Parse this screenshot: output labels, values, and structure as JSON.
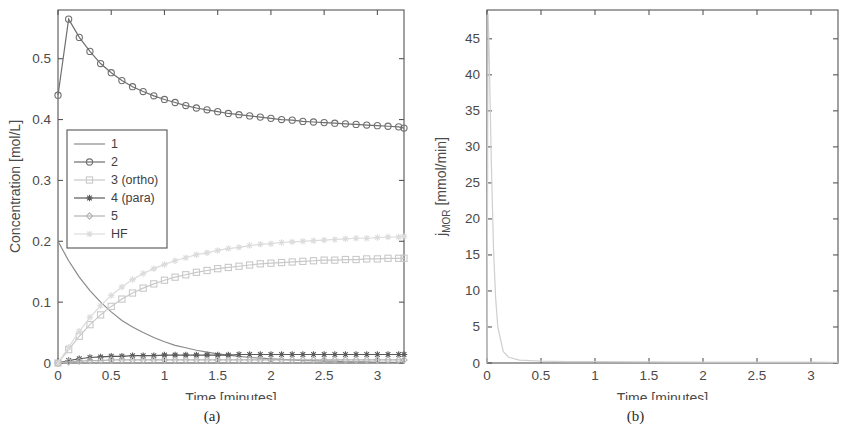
{
  "figure": {
    "caption_a": "(a)",
    "caption_b": "(b)"
  },
  "chart_data": [
    {
      "id": "panel-a",
      "type": "line",
      "title": "",
      "xlabel": "Time [minutes]",
      "ylabel": "Concentration [mol/L]",
      "xlim": [
        0,
        3.25
      ],
      "ylim": [
        0,
        0.58
      ],
      "xticks": [
        0,
        0.5,
        1,
        1.5,
        2,
        2.5,
        3
      ],
      "xticklabels": [
        "0",
        "0.5",
        "1",
        "1.5",
        "2",
        "2.5",
        "3"
      ],
      "yticks": [
        0,
        0.1,
        0.2,
        0.3,
        0.4,
        0.5
      ],
      "yticklabels": [
        "0",
        "0.1",
        "0.2",
        "0.3",
        "0.4",
        "0.5"
      ],
      "grid": false,
      "legend_position": "middle-left",
      "x": [
        0,
        0.1,
        0.2,
        0.3,
        0.4,
        0.5,
        0.6,
        0.7,
        0.8,
        0.9,
        1.0,
        1.1,
        1.2,
        1.3,
        1.4,
        1.5,
        1.6,
        1.7,
        1.8,
        1.9,
        2.0,
        2.1,
        2.2,
        2.3,
        2.4,
        2.5,
        2.6,
        2.7,
        2.8,
        2.9,
        3.0,
        3.1,
        3.2,
        3.25
      ],
      "series": [
        {
          "name": "1",
          "marker": "none",
          "color": "#8a8a8a",
          "values": [
            0.2,
            0.168,
            0.141,
            0.119,
            0.1,
            0.084,
            0.07,
            0.059,
            0.05,
            0.042,
            0.035,
            0.029,
            0.025,
            0.021,
            0.018,
            0.015,
            0.013,
            0.011,
            0.009,
            0.008,
            0.007,
            0.006,
            0.005,
            0.004,
            0.004,
            0.003,
            0.003,
            0.002,
            0.002,
            0.002,
            0.001,
            0.001,
            0.001,
            0.001
          ]
        },
        {
          "name": "2",
          "marker": "circle",
          "color": "#6f6f6f",
          "values": [
            0.44,
            0.565,
            0.535,
            0.512,
            0.492,
            0.477,
            0.464,
            0.454,
            0.446,
            0.439,
            0.433,
            0.428,
            0.423,
            0.419,
            0.416,
            0.413,
            0.41,
            0.408,
            0.406,
            0.404,
            0.402,
            0.4,
            0.399,
            0.397,
            0.396,
            0.395,
            0.394,
            0.393,
            0.392,
            0.391,
            0.39,
            0.389,
            0.388,
            0.386
          ]
        },
        {
          "name": "3 (ortho)",
          "marker": "square",
          "color": "#c9c9c9",
          "values": [
            0.0,
            0.022,
            0.044,
            0.063,
            0.079,
            0.093,
            0.105,
            0.115,
            0.123,
            0.13,
            0.136,
            0.141,
            0.145,
            0.149,
            0.152,
            0.155,
            0.157,
            0.159,
            0.161,
            0.163,
            0.164,
            0.165,
            0.166,
            0.167,
            0.168,
            0.169,
            0.169,
            0.17,
            0.17,
            0.171,
            0.171,
            0.172,
            0.172,
            0.172
          ]
        },
        {
          "name": "4 (para)",
          "marker": "star",
          "color": "#5a5a5a",
          "values": [
            0.0,
            0.004,
            0.007,
            0.009,
            0.01,
            0.011,
            0.011,
            0.012,
            0.012,
            0.012,
            0.013,
            0.013,
            0.013,
            0.013,
            0.013,
            0.013,
            0.013,
            0.014,
            0.014,
            0.014,
            0.014,
            0.014,
            0.014,
            0.014,
            0.014,
            0.014,
            0.014,
            0.014,
            0.014,
            0.014,
            0.014,
            0.014,
            0.014,
            0.014
          ]
        },
        {
          "name": "5",
          "marker": "diamond",
          "color": "#b4b4b4",
          "values": [
            0.0,
            0.002,
            0.003,
            0.004,
            0.004,
            0.005,
            0.005,
            0.005,
            0.005,
            0.005,
            0.005,
            0.005,
            0.005,
            0.005,
            0.005,
            0.005,
            0.005,
            0.005,
            0.005,
            0.005,
            0.005,
            0.005,
            0.005,
            0.005,
            0.005,
            0.005,
            0.005,
            0.005,
            0.005,
            0.005,
            0.005,
            0.005,
            0.005,
            0.005
          ]
        },
        {
          "name": "HF",
          "marker": "star",
          "color": "#dcdcdc",
          "values": [
            0.0,
            0.026,
            0.052,
            0.075,
            0.094,
            0.111,
            0.125,
            0.137,
            0.147,
            0.155,
            0.162,
            0.168,
            0.173,
            0.178,
            0.181,
            0.185,
            0.188,
            0.19,
            0.193,
            0.195,
            0.196,
            0.198,
            0.199,
            0.2,
            0.201,
            0.202,
            0.203,
            0.204,
            0.205,
            0.205,
            0.206,
            0.207,
            0.207,
            0.208
          ]
        }
      ]
    },
    {
      "id": "panel-b",
      "type": "line",
      "title": "",
      "xlabel": "Time [minutes]",
      "ylabel_main": "j",
      "ylabel_sub": "MOR",
      "ylabel_unit": " [mmol/min]",
      "xlim": [
        0,
        3.25
      ],
      "ylim": [
        0,
        49
      ],
      "xticks": [
        0,
        0.5,
        1,
        1.5,
        2,
        2.5,
        3
      ],
      "xticklabels": [
        "0",
        "0.5",
        "1",
        "1.5",
        "2",
        "2.5",
        "3"
      ],
      "yticks": [
        0,
        5,
        10,
        15,
        20,
        25,
        30,
        35,
        40,
        45
      ],
      "yticklabels": [
        "0",
        "5",
        "10",
        "15",
        "20",
        "25",
        "30",
        "35",
        "40",
        "45"
      ],
      "grid": false,
      "legend_position": "none",
      "x": [
        0,
        0.01,
        0.02,
        0.04,
        0.06,
        0.08,
        0.1,
        0.15,
        0.2,
        0.3,
        0.5,
        0.75,
        1.0,
        1.5,
        2.0,
        2.5,
        3.0,
        3.25
      ],
      "series": [
        {
          "name": "j_MOR",
          "marker": "none",
          "color": "#cfcfcf",
          "values": [
            0.0,
            48.5,
            43.0,
            28.0,
            16.0,
            9.0,
            5.0,
            1.6,
            0.8,
            0.4,
            0.25,
            0.2,
            0.18,
            0.15,
            0.13,
            0.12,
            0.11,
            0.1
          ]
        }
      ]
    }
  ]
}
